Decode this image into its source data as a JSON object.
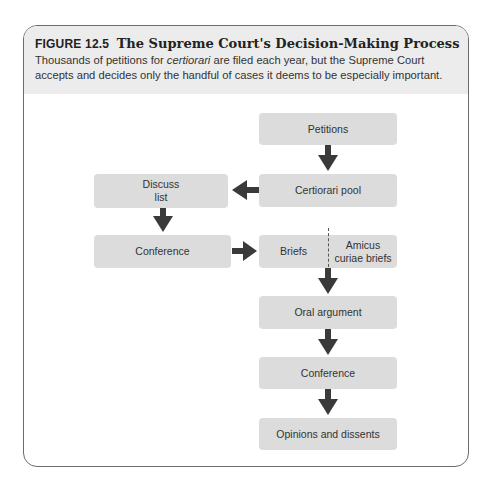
{
  "figure": {
    "label": "FIGURE 12.5",
    "title": "The Supreme Court's Decision-Making Process",
    "description_pre": "Thousands of petitions for ",
    "description_italic": "certiorari",
    "description_post": " are filed each year, but the Supreme Court accepts and decides only the handful of cases it deems to be especially important."
  },
  "nodes": {
    "petitions": "Petitions",
    "certiorari_pool": "Certiorari pool",
    "discuss_list_line1": "Discuss",
    "discuss_list_line2": "list",
    "conference_left": "Conference",
    "briefs": "Briefs",
    "amicus_line1": "Amicus",
    "amicus_line2": "curiae briefs",
    "oral_argument": "Oral argument",
    "conference_right": "Conference",
    "opinions": "Opinions and dissents"
  },
  "edges": [
    {
      "from": "petitions",
      "to": "certiorari_pool"
    },
    {
      "from": "certiorari_pool",
      "to": "discuss_list"
    },
    {
      "from": "discuss_list",
      "to": "conference_left"
    },
    {
      "from": "conference_left",
      "to": "briefs"
    },
    {
      "from": "briefs",
      "to": "oral_argument"
    },
    {
      "from": "oral_argument",
      "to": "conference_right"
    },
    {
      "from": "conference_right",
      "to": "opinions"
    }
  ],
  "colors": {
    "box": "#dcdcdc",
    "header": "#ececec",
    "arrow": "#3a3a3a",
    "border": "#6b6b6b"
  }
}
